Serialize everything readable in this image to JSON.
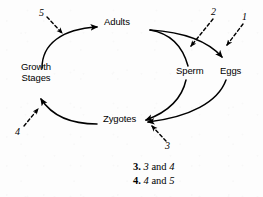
{
  "figure": {
    "type": "cycle-diagram",
    "nodes": [
      {
        "id": "adults",
        "label": "Adults",
        "x": 104,
        "y": 22
      },
      {
        "id": "growth-stages",
        "label": "Growth\nStages",
        "line1": "Growth",
        "line2": "Stages",
        "x": 14,
        "y": 66
      },
      {
        "id": "sperm",
        "label": "Sperm",
        "x": 176,
        "y": 70
      },
      {
        "id": "eggs",
        "label": "Eggs",
        "x": 222,
        "y": 70
      },
      {
        "id": "zygotes",
        "label": "Zygotes",
        "x": 103,
        "y": 118
      }
    ],
    "flow_arrows": [
      {
        "id": "growth-to-adults",
        "from": "growth-stages",
        "to": "adults",
        "style": "solid"
      },
      {
        "id": "adults-to-sperm",
        "from": "adults",
        "to": "sperm",
        "style": "solid"
      },
      {
        "id": "adults-to-eggs",
        "from": "adults",
        "to": "eggs",
        "style": "solid"
      },
      {
        "id": "sperm-to-zygotes",
        "from": "sperm",
        "to": "zygotes",
        "style": "solid"
      },
      {
        "id": "eggs-to-zygotes",
        "from": "eggs",
        "to": "zygotes",
        "style": "solid"
      },
      {
        "id": "zygotes-to-growth",
        "from": "zygotes",
        "to": "growth-stages",
        "style": "solid"
      }
    ],
    "reference_numbers": [
      {
        "id": "ref-5",
        "label": "5",
        "x": 39,
        "y": 8,
        "points_to": "growth-to-adults"
      },
      {
        "id": "ref-2",
        "label": "2",
        "x": 212,
        "y": 8,
        "points_to": "adults-to-sperm"
      },
      {
        "id": "ref-1",
        "label": "1",
        "x": 243,
        "y": 13,
        "points_to": "adults-to-eggs"
      },
      {
        "id": "ref-4",
        "label": "4",
        "x": 15,
        "y": 128,
        "points_to": "zygotes-to-growth"
      },
      {
        "id": "ref-3",
        "label": "3",
        "x": 166,
        "y": 142,
        "points_to": "zygotes"
      }
    ]
  },
  "answers": {
    "items": [
      {
        "key": "3.",
        "first": "3",
        "conj": " and ",
        "second": "4"
      },
      {
        "key": "4.",
        "first": "4",
        "conj": " and ",
        "second": "5"
      }
    ]
  },
  "colors": {
    "ink": "#000000",
    "background": "#fdfdfd"
  }
}
